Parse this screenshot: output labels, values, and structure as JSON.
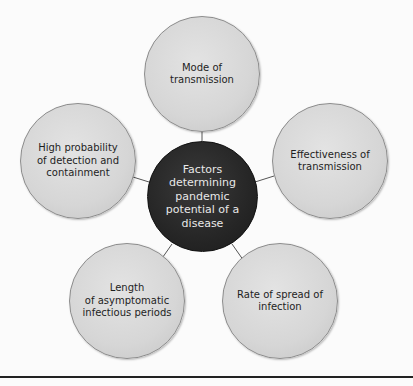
{
  "diagram": {
    "title": "Factors determining pandemic potential of a disease",
    "center": {
      "label": "Factors\ndetermining\npandemic\npotential of a\ndisease"
    },
    "nodes": [
      {
        "id": "mode",
        "label": "Mode of\ntransmission"
      },
      {
        "id": "effectiveness",
        "label": "Effectiveness of\ntransmission"
      },
      {
        "id": "rate",
        "label": "Rate of spread of\ninfection"
      },
      {
        "id": "length",
        "label": "Length\nof asymptomatic\ninfectious periods"
      },
      {
        "id": "detection",
        "label": "High probability\nof detection and\ncontainment"
      }
    ],
    "colors": {
      "center_fill": "#262626",
      "center_text": "#e8e8e8",
      "node_fill": "#d6d6d6",
      "node_text": "#1e1e1e",
      "connector": "#555555"
    }
  }
}
